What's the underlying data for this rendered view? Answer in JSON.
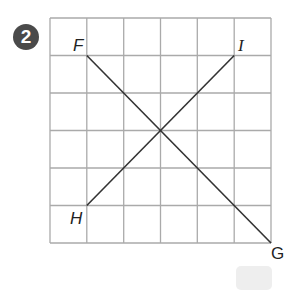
{
  "problem_number": "2",
  "grid": {
    "cols": 6,
    "rows": 6,
    "left": 50,
    "top": 18,
    "right": 271,
    "bottom": 243,
    "line_color": "#aaaaaa"
  },
  "lines": [
    {
      "name": "FG",
      "from": "F",
      "to": "G"
    },
    {
      "name": "HI",
      "from": "H",
      "to": "I"
    }
  ],
  "points": {
    "F": {
      "label": "F",
      "col": 1,
      "row": 1
    },
    "G": {
      "label": "G",
      "col": 6,
      "row": 6
    },
    "H": {
      "label": "H",
      "col": 1,
      "row": 5
    },
    "I": {
      "label": "I",
      "col": 5,
      "row": 1
    }
  },
  "answer_box": {
    "value": ""
  }
}
